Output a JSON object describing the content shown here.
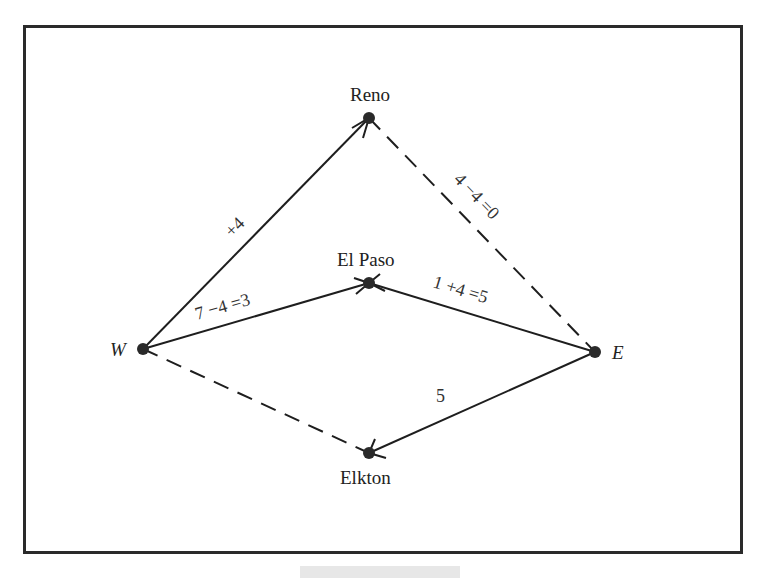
{
  "figure": {
    "type": "network-flow-diagram",
    "nodes": [
      {
        "id": "W",
        "label": "W",
        "italic": true,
        "x": 143,
        "y": 349
      },
      {
        "id": "E",
        "label": "E",
        "italic": true,
        "x": 595,
        "y": 352
      },
      {
        "id": "Reno",
        "label": "Reno",
        "italic": false,
        "x": 369,
        "y": 118
      },
      {
        "id": "ElPaso",
        "label": "El Paso",
        "italic": false,
        "x": 369,
        "y": 283
      },
      {
        "id": "Elkton",
        "label": "Elkton",
        "italic": false,
        "x": 369,
        "y": 453
      }
    ],
    "edges": [
      {
        "from": "W",
        "to": "Reno",
        "style": "solid",
        "label": "+4",
        "arrow_at": "Reno"
      },
      {
        "from": "W",
        "to": "ElPaso",
        "style": "solid",
        "label": "7 −4 =3",
        "arrow_at": "ElPaso"
      },
      {
        "from": "E",
        "to": "ElPaso",
        "style": "solid",
        "label": "1 +4 =5",
        "arrow_at": "ElPaso"
      },
      {
        "from": "Reno",
        "to": "E",
        "style": "dashed",
        "label": "4 −4 =0"
      },
      {
        "from": "W",
        "to": "Elkton",
        "style": "dashed",
        "label": ""
      },
      {
        "from": "E",
        "to": "Elkton",
        "style": "solid",
        "label": "5",
        "arrow_at": "Elkton"
      }
    ]
  },
  "labels": {
    "W": "W",
    "E": "E",
    "Reno": "Reno",
    "ElPaso": "El Paso",
    "Elkton": "Elkton",
    "edge_w_reno": "+4",
    "edge_w_elpaso": "7 −4 =3",
    "edge_e_elpaso": "1 +4 =5",
    "edge_reno_e": "4 −4 =0",
    "edge_e_elkton": "5"
  },
  "colors": {
    "ink": "#1e1e1e",
    "frame": "#2a2a2a",
    "background": "#ffffff"
  }
}
